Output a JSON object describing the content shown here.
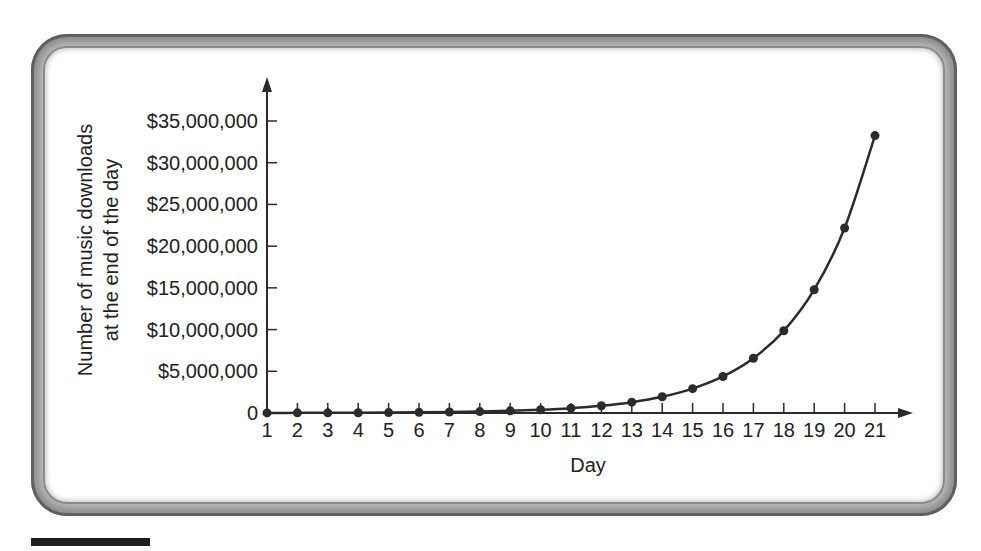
{
  "chart_data": {
    "type": "line",
    "title": "",
    "xlabel": "Day",
    "ylabel_lines": [
      "Number of music downloads",
      "at the end of the day"
    ],
    "ylabel": "Number of music downloads at the end of the day",
    "x": [
      1,
      2,
      3,
      4,
      5,
      6,
      7,
      8,
      9,
      10,
      11,
      12,
      13,
      14,
      15,
      16,
      17,
      18,
      19,
      20,
      21
    ],
    "x_tick_labels": [
      "1",
      "2",
      "3",
      "4",
      "5",
      "6",
      "7",
      "8",
      "9",
      "10",
      "11",
      "12",
      "13",
      "14",
      "15",
      "16",
      "17",
      "18",
      "19",
      "20",
      "21"
    ],
    "series": [
      {
        "name": "Downloads",
        "values": [
          10000,
          15000,
          22500,
          33750,
          50625,
          75938,
          113906,
          170859,
          256289,
          384434,
          576650,
          864976,
          1297463,
          1946195,
          2919293,
          4378939,
          6568408,
          9852613,
          14778919,
          22168378,
          33252567
        ]
      }
    ],
    "y_ticks": [
      0,
      5000000,
      10000000,
      15000000,
      20000000,
      25000000,
      30000000,
      35000000
    ],
    "y_tick_labels": [
      "0",
      "$5,000,000",
      "$10,000,000",
      "$15,000,000",
      "$20,000,000",
      "$25,000,000",
      "$30,000,000",
      "$35,000,000"
    ],
    "ylim": [
      0,
      35000000
    ],
    "xlim": [
      1,
      21
    ],
    "grid": false,
    "legend": null,
    "markers": true,
    "line_color": "#2b2b2b"
  }
}
